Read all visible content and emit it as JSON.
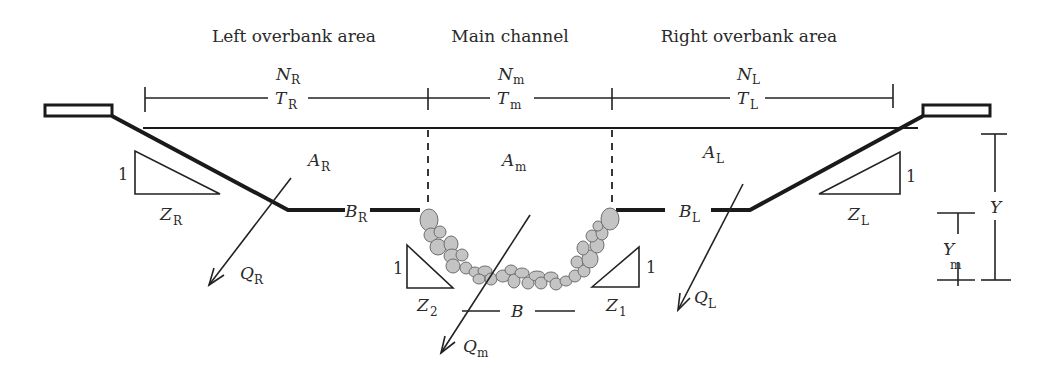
{
  "diagram": {
    "type": "compound channel cross-section",
    "regions": {
      "left": {
        "title": "Left overbank area",
        "roughness": {
          "base": "N",
          "sub": "R"
        },
        "top_width": {
          "base": "T",
          "sub": "R"
        },
        "area": {
          "base": "A",
          "sub": "R"
        },
        "bottom_width": {
          "base": "B",
          "sub": "R"
        },
        "discharge": {
          "base": "Q",
          "sub": "R"
        },
        "side_slope": {
          "base": "Z",
          "sub": "R",
          "rise": "1"
        }
      },
      "main": {
        "title": "Main channel",
        "roughness": {
          "base": "N",
          "sub": "m"
        },
        "top_width": {
          "base": "T",
          "sub": "m"
        },
        "area": {
          "base": "A",
          "sub": "m"
        },
        "bottom_width": {
          "base": "B",
          "sub": ""
        },
        "discharge": {
          "base": "Q",
          "sub": "m"
        },
        "side_slope_left": {
          "base": "Z",
          "sub": "2",
          "rise": "1"
        },
        "side_slope_right": {
          "base": "Z",
          "sub": "1",
          "rise": "1"
        }
      },
      "right": {
        "title": "Right overbank area",
        "roughness": {
          "base": "N",
          "sub": "L"
        },
        "top_width": {
          "base": "T",
          "sub": "L"
        },
        "area": {
          "base": "A",
          "sub": "L"
        },
        "bottom_width": {
          "base": "B",
          "sub": "L"
        },
        "discharge": {
          "base": "Q",
          "sub": "L"
        },
        "side_slope": {
          "base": "Z",
          "sub": "L",
          "rise": "1"
        }
      }
    },
    "depths": {
      "total": {
        "base": "Y",
        "sub": ""
      },
      "main": {
        "base": "Y",
        "sub": "m"
      }
    },
    "colors": {
      "line": "#1a1a1a",
      "rock_fill": "#c4c4c4",
      "rock_stroke": "#6e6e6e",
      "background": "#ffffff"
    }
  }
}
